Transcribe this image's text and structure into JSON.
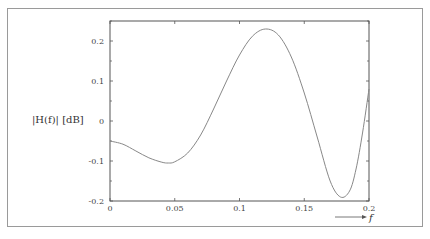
{
  "chart_data": {
    "type": "line",
    "title": "",
    "xlabel": "f",
    "ylabel": "|H(f)| [dB]",
    "xlim": [
      0,
      0.2
    ],
    "ylim": [
      -0.2,
      0.25
    ],
    "x_ticks": [
      0,
      0.05,
      0.1,
      0.15,
      0.2
    ],
    "x_tick_labels": [
      "0",
      "0.05",
      "0.1",
      "0.15",
      "0.2"
    ],
    "y_ticks": [
      -0.2,
      -0.1,
      0,
      0.1,
      0.2
    ],
    "y_tick_labels": [
      "-0.2",
      "-0.1",
      "0",
      "0.1",
      "0.2"
    ],
    "grid": false,
    "legend": null,
    "series": [
      {
        "name": "|H(f)|",
        "color": "#888888",
        "x": [
          0,
          0.01,
          0.02,
          0.03,
          0.04,
          0.045,
          0.05,
          0.06,
          0.07,
          0.08,
          0.09,
          0.1,
          0.11,
          0.12,
          0.13,
          0.14,
          0.15,
          0.16,
          0.17,
          0.178,
          0.185,
          0.19,
          0.195,
          0.2
        ],
        "values": [
          -0.05,
          -0.058,
          -0.075,
          -0.092,
          -0.103,
          -0.105,
          -0.102,
          -0.08,
          -0.035,
          0.03,
          0.1,
          0.165,
          0.212,
          0.23,
          0.215,
          0.16,
          0.07,
          -0.04,
          -0.15,
          -0.19,
          -0.175,
          -0.12,
          -0.03,
          0.08
        ]
      }
    ]
  },
  "labels": {
    "ylabel": "|H(f)| [dB]",
    "xlabel": "f"
  }
}
